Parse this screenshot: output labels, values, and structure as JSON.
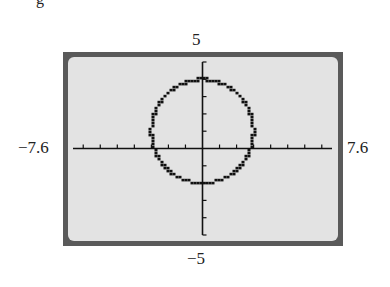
{
  "figure": {
    "corner_glyph": "g"
  },
  "window": {
    "xmin_label": "−7.6",
    "xmax_label": "7.6",
    "ymax_label": "5",
    "ymin_label": "−5"
  },
  "colors": {
    "frame": "#5a5a5a",
    "screen": "#e3e3e3",
    "ink": "#111111"
  },
  "chart_data": {
    "type": "line",
    "title": "",
    "xlabel": "",
    "ylabel": "",
    "xlim": [
      -7.6,
      7.6
    ],
    "ylim": [
      -5,
      5
    ],
    "xscale": 1,
    "yscale": 1,
    "grid": false,
    "legend": null,
    "x_tick_labels": [
      "−7.6",
      "7.6"
    ],
    "y_tick_labels": [
      "−5",
      "5"
    ],
    "series": [
      {
        "name": "circle",
        "equation": "x^2 + (y - 1)^2 = 9",
        "center": [
          0,
          1
        ],
        "radius": 3,
        "style": "pixelated graphing-calculator plot"
      }
    ]
  }
}
